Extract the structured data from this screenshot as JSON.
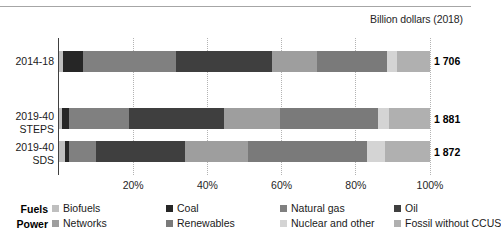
{
  "header": {
    "unit_caption": "Billion dollars (2018)"
  },
  "axis": {
    "tick_labels": [
      "20%",
      "40%",
      "60%",
      "80%",
      "100%"
    ],
    "tick_values": [
      20,
      40,
      60,
      80,
      100
    ],
    "xmin": 0,
    "xmax": 100
  },
  "legend": {
    "row_titles": [
      "Fuels",
      "Power"
    ],
    "fuels": [
      {
        "label": "Biofuels",
        "color": "#bfbfbf"
      },
      {
        "label": "Coal",
        "color": "#262626"
      },
      {
        "label": "Natural gas",
        "color": "#808080"
      },
      {
        "label": "Oil",
        "color": "#3f3f3f"
      }
    ],
    "power": [
      {
        "label": "Networks",
        "color": "#9e9e9e"
      },
      {
        "label": "Renewables",
        "color": "#7a7a7a"
      },
      {
        "label": "Nuclear and other",
        "color": "#d4d4d4"
      },
      {
        "label": "Fossil without CCUS",
        "color": "#b0b0b0"
      }
    ]
  },
  "chart_data": {
    "type": "bar",
    "title": "",
    "subtitle": "",
    "xlabel": "",
    "ylabel": "",
    "unit": "Billion dollars (2018)",
    "orientation": "horizontal",
    "stacked": true,
    "normalized_percent": true,
    "grid": true,
    "legend_position": "bottom",
    "xlim": [
      0,
      100
    ],
    "categories": [
      "2014-18",
      "2019-40\nSTEPS",
      "2019-40\nSDS"
    ],
    "category_labels": [
      "2014-18",
      "2019-40 STEPS",
      "2019-40 SDS"
    ],
    "totals": [
      "1 706",
      "1 881",
      "1 872"
    ],
    "totals_numeric": [
      1706,
      1881,
      1872
    ],
    "series": [
      {
        "name": "Biofuels",
        "group": "Fuels",
        "color": "#bfbfbf",
        "values": [
          1.0,
          0.8,
          1.5
        ]
      },
      {
        "name": "Coal",
        "group": "Fuels",
        "color": "#262626",
        "values": [
          5.5,
          2.0,
          1.2
        ]
      },
      {
        "name": "Natural gas",
        "group": "Fuels",
        "color": "#808080",
        "values": [
          25.0,
          16.2,
          7.3
        ]
      },
      {
        "name": "Oil",
        "group": "Fuels",
        "color": "#3f3f3f",
        "values": [
          26.0,
          25.5,
          24.0
        ]
      },
      {
        "name": "Networks",
        "group": "Power",
        "color": "#9e9e9e",
        "values": [
          12.0,
          15.0,
          17.0
        ]
      },
      {
        "name": "Renewables",
        "group": "Power",
        "color": "#7a7a7a",
        "values": [
          19.0,
          26.5,
          32.0
        ]
      },
      {
        "name": "Nuclear and other",
        "group": "Power",
        "color": "#d4d4d4",
        "values": [
          2.5,
          3.0,
          5.0
        ]
      },
      {
        "name": "Fossil without CCUS",
        "group": "Power",
        "color": "#b0b0b0",
        "values": [
          9.0,
          11.0,
          12.0
        ]
      }
    ]
  }
}
